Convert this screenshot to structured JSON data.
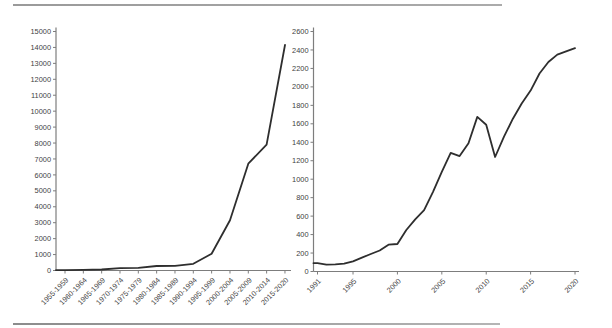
{
  "page": {
    "background": "#ffffff",
    "rule_color": "#9a9a9a"
  },
  "chart_data": [
    {
      "type": "line",
      "title": "",
      "xlabel": "",
      "ylabel": "",
      "categories": [
        "1955-1959",
        "1960-1964",
        "1965-1969",
        "1970-1974",
        "1975-1979",
        "1980-1984",
        "1985-1989",
        "1990-1994",
        "1995-1999",
        "2000-2004",
        "2005-2009",
        "2010-2014",
        "2015-2020"
      ],
      "values": [
        20,
        35,
        60,
        150,
        165,
        280,
        295,
        420,
        1050,
        3150,
        6700,
        7900,
        14150
      ],
      "ylim": [
        0,
        15000
      ],
      "ytick_step": 1000,
      "grid": false,
      "legend": "none",
      "line_color": "#2e2e2e",
      "axis_color": "#7d7d7d",
      "label_color": "#3f3f3f"
    },
    {
      "type": "line",
      "title": "",
      "xlabel": "",
      "ylabel": "",
      "x": [
        1991,
        1992,
        1993,
        1994,
        1995,
        1996,
        1997,
        1998,
        1999,
        2000,
        2001,
        2002,
        2003,
        2004,
        2005,
        2006,
        2007,
        2008,
        2009,
        2010,
        2011,
        2012,
        2013,
        2014,
        2015,
        2016,
        2017,
        2018,
        2019,
        2020
      ],
      "values": [
        90,
        75,
        78,
        85,
        110,
        150,
        190,
        228,
        290,
        298,
        450,
        565,
        665,
        860,
        1080,
        1285,
        1250,
        1390,
        1675,
        1590,
        1240,
        1460,
        1655,
        1820,
        1960,
        2145,
        2270,
        2350,
        2385,
        2420
      ],
      "xticks": [
        1991,
        1995,
        2000,
        2005,
        2010,
        2015,
        2020
      ],
      "ylim": [
        0,
        2600
      ],
      "ytick_step": 200,
      "grid": false,
      "legend": "none",
      "line_color": "#2e2e2e",
      "axis_color": "#7d7d7d",
      "label_color": "#3f3f3f"
    }
  ]
}
